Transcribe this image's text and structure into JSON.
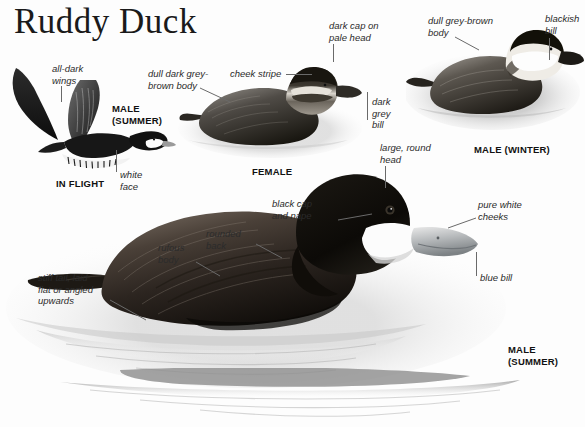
{
  "page": {
    "title": "Ruddy Duck",
    "background_color": "#fdfdfd",
    "text_color": "#2b2b2b"
  },
  "figures": [
    {
      "id": "in-flight",
      "caption": "IN FLIGHT",
      "sub_caption": "MALE\n(SUMMER)",
      "annotations": [
        {
          "name": "all-dark-wings",
          "text": "all-dark\nwings"
        },
        {
          "name": "white-face",
          "text": "white\nface"
        }
      ]
    },
    {
      "id": "female",
      "caption": "FEMALE",
      "annotations": [
        {
          "name": "dull-dark-grey-brown-body",
          "text": "dull dark grey-\nbrown body"
        },
        {
          "name": "cheek-stripe",
          "text": "cheek stripe"
        },
        {
          "name": "dark-cap-on-pale-head",
          "text": "dark cap on\npale head"
        },
        {
          "name": "dark-grey-bill",
          "text": "dark\ngrey\nbill"
        }
      ]
    },
    {
      "id": "male-winter",
      "caption": "MALE (WINTER)",
      "annotations": [
        {
          "name": "dull-grey-brown-body",
          "text": "dull grey-brown\nbody"
        },
        {
          "name": "blackish-bill",
          "text": "blackish\nbill"
        }
      ]
    },
    {
      "id": "male-summer",
      "caption": "MALE\n(SUMMER)",
      "annotations": [
        {
          "name": "large-round-head",
          "text": "large, round\nhead"
        },
        {
          "name": "black-cap-and-nape",
          "text": "black cap\nand nape"
        },
        {
          "name": "pure-white-cheeks",
          "text": "pure white\ncheeks"
        },
        {
          "name": "blue-bill",
          "text": "blue bill"
        },
        {
          "name": "rounded-back",
          "text": "rounded\nback"
        },
        {
          "name": "rufous-body",
          "text": "rufous\nbody"
        },
        {
          "name": "stiff-tail",
          "text": "stiff tail, laid\nflat or angled\nupwards"
        }
      ]
    }
  ],
  "labels": {
    "title": "Ruddy Duck",
    "all_dark_wings": "all-dark\nwings",
    "in_flight": "IN FLIGHT",
    "male_summer_flight": "MALE\n(SUMMER)",
    "white_face": "white\nface",
    "dull_dark_grey_brown_body": "dull dark grey-\nbrown body",
    "cheek_stripe": "cheek stripe",
    "dark_cap_on_pale_head": "dark cap on\npale head",
    "dark_grey_bill": "dark\ngrey\nbill",
    "female": "FEMALE",
    "dull_grey_brown_body": "dull grey-brown\nbody",
    "blackish_bill": "blackish\nbill",
    "male_winter": "MALE (WINTER)",
    "large_round_head": "large, round\nhead",
    "black_cap_and_nape": "black cap\nand nape",
    "pure_white_cheeks": "pure white\ncheeks",
    "blue_bill": "blue bill",
    "rounded_back": "rounded\nback",
    "rufous_body": "rufous\nbody",
    "stiff_tail": "stiff tail, laid\nflat or angled\nupwards",
    "male_summer_main": "MALE\n(SUMMER)"
  }
}
